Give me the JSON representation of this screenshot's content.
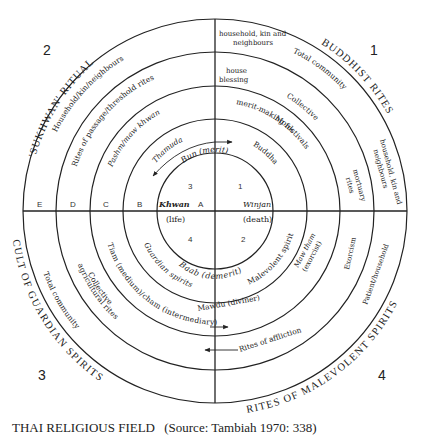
{
  "diagram": {
    "quadrant_numbers": [
      "1",
      "2",
      "3",
      "4"
    ],
    "outer_titles": {
      "q1": "BUDDHIST RITES",
      "q2": "'SUKHWAN' RITUAL",
      "q3": "CULT OF GUARDIAN SPIRITS",
      "q4": "RITES OF MALEVOLENT SPIRITS"
    },
    "ring_letters": [
      "E",
      "D",
      "C",
      "B",
      "A"
    ],
    "center": {
      "top": "Bun (merit)",
      "bottom": "Baab (demerit)",
      "left_word": "Khwan",
      "left_gloss": "(life)",
      "right_word": "Winjan",
      "right_gloss": "(death)",
      "cell_numbers": [
        "3",
        "1",
        "4",
        "2"
      ]
    },
    "q1_labels": {
      "ring_b": "Buddha",
      "ring_c": "Monk",
      "ring_d_a": "Collective",
      "ring_d_b": "merit-making festivals",
      "ring_e": "Total community",
      "top_d_a": "house",
      "top_d_b": "blessing",
      "top_e_a": "household, kin and",
      "top_e_b": "neighbours",
      "side_d_a": "mortuary",
      "side_d_b": "rites",
      "side_e_a": "household, kin and",
      "side_e_b": "neighbours"
    },
    "q2_labels": {
      "ring_b": "Thamuda",
      "ring_c": "Pashm/maw khwan",
      "ring_d": "Rites of passage/threshold rites",
      "ring_e": "Household/kin/neighbours"
    },
    "q3_labels": {
      "ring_b": "Guardian spirits",
      "ring_c": "Tiam (medium)/cham (intermediary)",
      "ring_d_a": "Collective",
      "ring_d_b": "agricultural rites",
      "ring_e": "Total community"
    },
    "q4_labels": {
      "ring_b": "Malevolent spirits",
      "ring_c_a": "Maw tham",
      "ring_c_b": "(exorcist)",
      "ring_c_bottom": "Mawdu (diviner)",
      "ring_d": "Exorcism",
      "ring_d_bottom": "Rites of affliction",
      "ring_e": "Patient/household"
    }
  },
  "caption": {
    "title": "THAI RELIGIOUS FIELD",
    "source": "(Source: Tambiah 1970: 338)"
  }
}
